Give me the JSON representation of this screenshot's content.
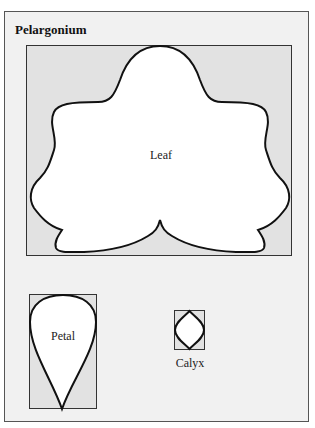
{
  "title": "Pelargonium",
  "parts": {
    "leaf": {
      "label": "Leaf"
    },
    "petal": {
      "label": "Petal"
    },
    "calyx": {
      "label": "Calyx"
    }
  },
  "colors": {
    "background": "#f1f1f1",
    "bounding_box_fill": "#e2e2e2",
    "shape_fill": "#ffffff",
    "stroke": "#111111"
  }
}
